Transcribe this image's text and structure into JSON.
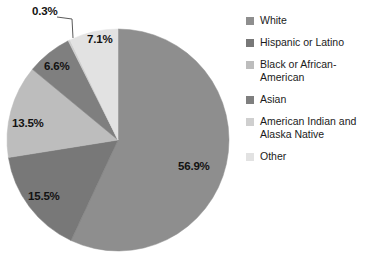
{
  "chart_data": {
    "type": "pie",
    "title": "",
    "legend_position": "right",
    "categories": [
      "White",
      "Hispanic or Latino",
      "Black or African-American",
      "Asian",
      "American Indian and Alaska Native",
      "Other"
    ],
    "values": [
      56.9,
      15.5,
      13.5,
      6.6,
      0.3,
      7.1
    ],
    "value_labels": [
      "56.9%",
      "15.5%",
      "13.5%",
      "6.6%",
      "0.3%",
      "7.1%"
    ],
    "colors": [
      "#8e8e8e",
      "#787878",
      "#bdbdbd",
      "#7f7f7f",
      "#cfcfcf",
      "#e2e2e2"
    ],
    "units": "percent",
    "start_angle": 0,
    "direction": "clockwise",
    "slices": [
      {
        "label": "White",
        "value": 56.9,
        "display": "56.9%",
        "color": "#8e8e8e",
        "label_x": 178,
        "label_y": 160
      },
      {
        "label": "Hispanic or Latino",
        "value": 15.5,
        "display": "15.5%",
        "color": "#787878",
        "label_x": 28,
        "label_y": 190
      },
      {
        "label": "Black or African-American",
        "value": 13.5,
        "display": "13.5%",
        "color": "#bdbdbd",
        "label_x": 12,
        "label_y": 117
      },
      {
        "label": "Asian",
        "value": 6.6,
        "display": "6.6%",
        "color": "#7f7f7f",
        "label_x": 44,
        "label_y": 60
      },
      {
        "label": "American Indian and Alaska Native",
        "value": 0.3,
        "display": "0.3%",
        "color": "#cfcfcf",
        "label_x": 32,
        "label_y": 5
      },
      {
        "label": "Other",
        "value": 7.1,
        "display": "7.1%",
        "color": "#e2e2e2",
        "label_x": 87,
        "label_y": 33
      }
    ]
  },
  "legend": {
    "items": [
      {
        "label": "White",
        "color": "#8e8e8e"
      },
      {
        "label": "Hispanic or Latino",
        "color": "#787878"
      },
      {
        "label": "Black or African-American",
        "color": "#bdbdbd"
      },
      {
        "label": "Asian",
        "color": "#7f7f7f"
      },
      {
        "label": "American Indian and Alaska Native",
        "color": "#cfcfcf"
      },
      {
        "label": "Other",
        "color": "#e2e2e2"
      }
    ]
  }
}
